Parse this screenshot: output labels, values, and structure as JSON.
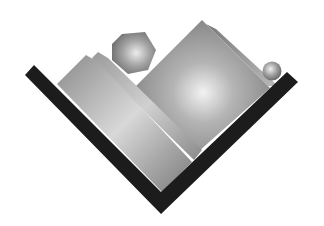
{
  "image": {
    "description": "3D-rendered illustration of geometric shapes resting in a dark V-shaped trough",
    "background": "#ffffff"
  },
  "colors": {
    "trough": "#1c1c1c",
    "shape_dark": "#6e6e6e",
    "shape_mid": "#9a9a9a",
    "shape_light": "#e6e6e6",
    "highlight": "#f4f4f4"
  },
  "shapes": [
    {
      "id": "trough",
      "kind": "v-trough",
      "label": "dark V container"
    },
    {
      "id": "left-slab",
      "kind": "slab",
      "label": "left tilted slab"
    },
    {
      "id": "middle-slab",
      "kind": "slab",
      "label": "thin middle slab"
    },
    {
      "id": "back-slab",
      "kind": "slab",
      "label": "back slab behind cube"
    },
    {
      "id": "big-cube",
      "kind": "cube",
      "label": "large tilted cube"
    },
    {
      "id": "hexagon",
      "kind": "hexagonal prism",
      "label": "hexagon"
    },
    {
      "id": "sphere",
      "kind": "sphere",
      "label": "small sphere"
    }
  ]
}
